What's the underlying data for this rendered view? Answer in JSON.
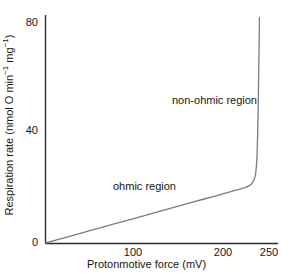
{
  "figure": {
    "background_color": "#ffffff",
    "axis_color": "#2b2b2b",
    "curve_color": "#7d7d7d"
  },
  "chart_data": {
    "type": "line",
    "title": "",
    "subtitle": "",
    "xlabel": "Protonmotive force (mV)",
    "ylabel": "Respiration rate (nmol O min⁻¹ mg⁻¹)",
    "ylabel_parts": {
      "prefix": "Respiration rate (nmol O min",
      "sup1": "−1",
      "middle": " mg",
      "sup2": "−1",
      "suffix": ")"
    },
    "xlim": [
      0,
      258
    ],
    "ylim": [
      0,
      83
    ],
    "xticks": [
      100,
      200,
      250
    ],
    "xtick_labels": [
      "100",
      "200",
      "250"
    ],
    "yticks": [
      0,
      40,
      80
    ],
    "ytick_labels": [
      "0",
      "40",
      "80"
    ],
    "grid": false,
    "legend": "none",
    "tick_marks_visible": false,
    "series": [
      {
        "name": "respiration rate vs protonmotive force",
        "color": "#7d7d7d",
        "x": [
          0,
          20,
          40,
          60,
          80,
          100,
          120,
          140,
          160,
          180,
          200,
          210,
          218,
          224,
          228,
          231,
          233,
          235,
          236,
          237,
          237.5,
          238,
          238.5,
          239,
          239.5,
          240
        ],
        "y": [
          0,
          1.8,
          3.6,
          5.4,
          7.2,
          9.0,
          10.8,
          12.6,
          14.4,
          16.2,
          18.0,
          18.9,
          19.6,
          20.2,
          20.8,
          21.5,
          22.4,
          24.0,
          26.0,
          30.0,
          34.0,
          40.0,
          48.0,
          58.0,
          70.0,
          82.0
        ]
      }
    ],
    "annotations": [
      {
        "text": "ohmic region",
        "x": 78,
        "y": 22
      },
      {
        "text": "non-ohmic region",
        "x": 143,
        "y": 54
      }
    ]
  }
}
